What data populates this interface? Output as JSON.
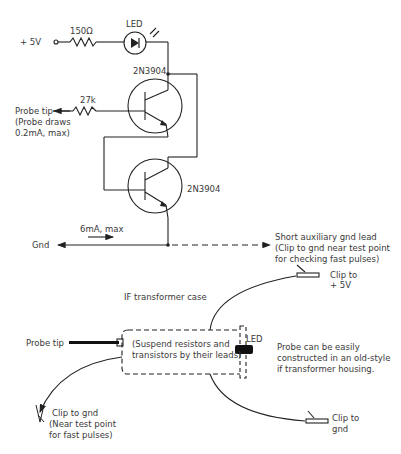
{
  "schematic": {
    "supply_label": "+ 5V",
    "resistor_led": "150Ω",
    "led_label": "LED",
    "transistor_top": "2N3904",
    "transistor_bottom": "2N3904",
    "resistor_base": "27k",
    "probe_tip": "Probe tip",
    "probe_note_1": "(Probe draws",
    "probe_note_2": "0.2mA, max)",
    "current_label": "6mA, max",
    "gnd_label": "Gnd",
    "aux_gnd_1": "Short auxiliary gnd lead",
    "aux_gnd_2": "(Clip to gnd near test point",
    "aux_gnd_3": "for checking fast pulses)"
  },
  "assembly": {
    "case_label": "IF transformer case",
    "probe_tip": "Probe tip",
    "suspend_1": "(Suspend resistors and",
    "suspend_2": "transistors by their leads)",
    "led_label": "LED",
    "note_1": "Probe can be easily",
    "note_2": "constructed in an old-style",
    "note_3": "if transformer housing.",
    "clip_5v_1": "Clip to",
    "clip_5v_2": "+ 5V",
    "clip_gnd_1": "Clip to",
    "clip_gnd_2": "gnd",
    "clip_near_1": "Clip to gnd",
    "clip_near_2": "(Near test point",
    "clip_near_3": "for fast pulses)"
  }
}
